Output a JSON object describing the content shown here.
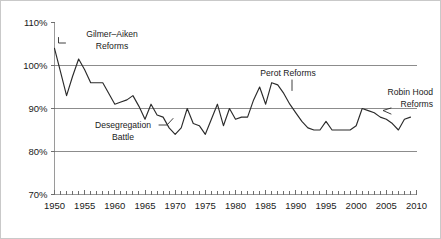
{
  "chart_data": {
    "type": "line",
    "title": "",
    "subtitle": "",
    "xlabel": "",
    "ylabel": "",
    "xlim": [
      1950,
      2010
    ],
    "ylim": [
      70,
      110
    ],
    "y_tick_labels": [
      "110%",
      "100%",
      "90%",
      "80%",
      "70%"
    ],
    "y_tick_values": [
      110,
      100,
      90,
      80,
      70
    ],
    "x_tick_labels": [
      "1950",
      "1955",
      "1960",
      "1965",
      "1970",
      "1975",
      "1980",
      "1985",
      "1990",
      "1995",
      "2000",
      "2005",
      "2010"
    ],
    "x_tick_values": [
      1950,
      1955,
      1960,
      1965,
      1970,
      1975,
      1980,
      1985,
      1990,
      1995,
      2000,
      2005,
      2010
    ],
    "x_minor_tick_interval": 1,
    "grid": "horizontal",
    "legend": "none",
    "series": [
      {
        "name": "value",
        "x": [
          1950,
          1951,
          1952,
          1953,
          1954,
          1955,
          1956,
          1957,
          1958,
          1959,
          1960,
          1961,
          1962,
          1963,
          1964,
          1965,
          1966,
          1967,
          1968,
          1969,
          1970,
          1971,
          1972,
          1973,
          1974,
          1975,
          1976,
          1977,
          1978,
          1979,
          1980,
          1981,
          1982,
          1983,
          1984,
          1985,
          1986,
          1987,
          1988,
          1989,
          1990,
          1991,
          1992,
          1993,
          1994,
          1995,
          1996,
          1997,
          1998,
          1999,
          2000,
          2001,
          2002,
          2003,
          2004,
          2005,
          2006,
          2007,
          2008,
          2009
        ],
        "values": [
          104,
          98.5,
          93,
          97.5,
          101.5,
          99,
          96,
          96,
          96,
          93.5,
          91,
          91.5,
          92,
          93,
          90.5,
          87.5,
          91,
          88.5,
          88,
          85.5,
          84,
          85.5,
          90,
          86.5,
          86,
          84,
          87.5,
          91,
          86,
          90,
          87.5,
          88,
          88,
          92,
          95,
          91,
          96,
          95.5,
          93.5,
          91,
          89,
          87,
          85.5,
          85,
          85,
          87,
          85,
          85,
          85,
          85,
          86,
          90,
          89.5,
          89,
          88,
          87.5,
          86.5,
          85,
          87.5,
          88
        ]
      }
    ],
    "annotations": [
      {
        "id": "gilmer-aiken",
        "lines": [
          "Gilmer–Aiken",
          "Reforms"
        ],
        "target_x": 1950,
        "target_y": 104
      },
      {
        "id": "desegregation",
        "lines": [
          "Desegregation",
          "Battle"
        ],
        "target_x": 1966,
        "target_y": 87.5
      },
      {
        "id": "perot",
        "lines": [
          "Perot Reforms"
        ],
        "target_x": 1986,
        "target_y": 96
      },
      {
        "id": "robin-hood",
        "lines": [
          "Robin Hood",
          "Reforms"
        ],
        "target_x": 2001,
        "target_y": 90
      }
    ],
    "colors": {
      "line": "#2b2b2b",
      "grid": "#8c8c8c",
      "axis": "#9a9a9a",
      "text": "#1a1a1a",
      "background": "#ffffff",
      "border": "#c9c9c9",
      "top_rule_gradient_start": "#8fd08f",
      "top_rule_gradient_end": "#6f78c8"
    }
  }
}
